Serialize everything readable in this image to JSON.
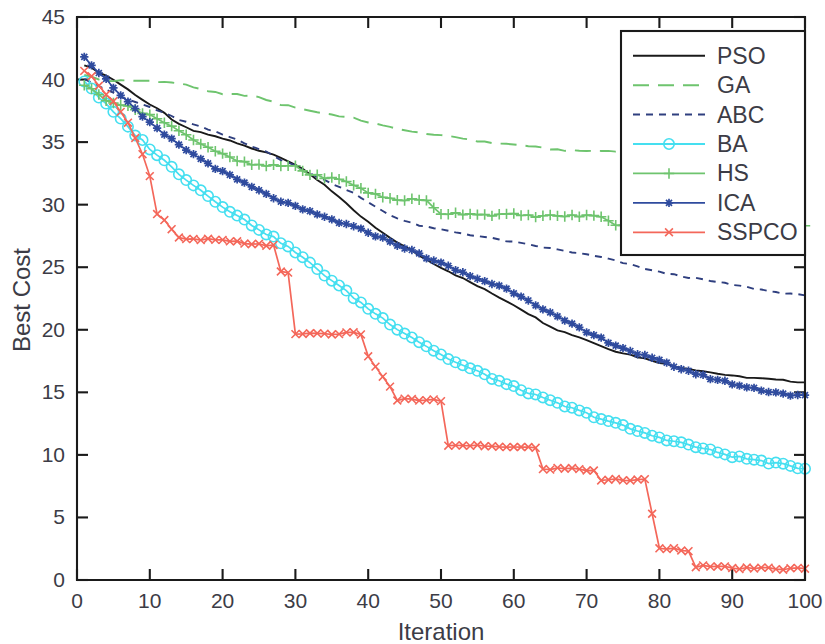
{
  "chart_data": {
    "type": "line",
    "title": "",
    "xlabel": "Iteration",
    "ylabel": "Best Cost",
    "xlim": [
      0,
      100
    ],
    "ylim": [
      0,
      45
    ],
    "xticks": [
      0,
      10,
      20,
      30,
      40,
      50,
      60,
      70,
      80,
      90,
      100
    ],
    "yticks": [
      0,
      5,
      10,
      15,
      20,
      25,
      30,
      35,
      40,
      45
    ],
    "grid": false,
    "legend_position": "top-right",
    "series": [
      {
        "name": "PSO",
        "color": "#1a1a1a",
        "style": "solid",
        "marker": "none",
        "x": [
          1,
          2,
          3,
          4,
          5,
          6,
          7,
          8,
          9,
          10,
          12,
          14,
          16,
          18,
          20,
          22,
          24,
          26,
          28,
          30,
          32,
          34,
          36,
          38,
          40,
          42,
          44,
          46,
          48,
          50,
          52,
          54,
          56,
          58,
          60,
          62,
          64,
          66,
          68,
          70,
          72,
          74,
          76,
          78,
          80,
          82,
          84,
          86,
          88,
          90,
          92,
          94,
          96,
          98,
          100
        ],
        "y": [
          41.2,
          40.9,
          40.6,
          40.3,
          40.0,
          39.6,
          39.2,
          38.8,
          38.4,
          38.0,
          37.3,
          36.4,
          35.9,
          35.6,
          35.3,
          34.9,
          34.5,
          34.2,
          33.8,
          33.2,
          32.4,
          31.6,
          30.6,
          29.5,
          28.6,
          27.7,
          27.0,
          26.3,
          25.6,
          25.0,
          24.4,
          23.8,
          23.2,
          22.6,
          22.0,
          21.3,
          20.6,
          20.0,
          19.6,
          19.2,
          18.7,
          18.3,
          18.0,
          17.7,
          17.4,
          17.1,
          16.9,
          16.7,
          16.5,
          16.3,
          16.2,
          16.1,
          16.0,
          15.9,
          15.8
        ]
      },
      {
        "name": "GA",
        "color": "#6ec46e",
        "style": "dashed",
        "marker": "none",
        "x": [
          1,
          2,
          3,
          4,
          5,
          6,
          8,
          10,
          12,
          14,
          16,
          18,
          20,
          22,
          24,
          26,
          28,
          30,
          32,
          34,
          36,
          38,
          40,
          42,
          44,
          46,
          48,
          50,
          52,
          54,
          56,
          58,
          60,
          62,
          64,
          66,
          68,
          70,
          72,
          74,
          76,
          78,
          80,
          82,
          84,
          86,
          88,
          90,
          92,
          94,
          96,
          98,
          100
        ],
        "y": [
          40.4,
          40.2,
          40.0,
          39.9,
          39.9,
          39.9,
          39.9,
          39.9,
          39.8,
          39.7,
          39.4,
          39.1,
          38.8,
          38.8,
          38.7,
          38.4,
          38.0,
          37.8,
          37.5,
          37.3,
          37.1,
          36.9,
          36.6,
          36.3,
          36.1,
          35.8,
          35.7,
          35.5,
          35.4,
          35.2,
          35.0,
          34.9,
          34.8,
          34.7,
          34.5,
          34.4,
          34.3,
          34.3,
          34.3,
          34.3,
          34.3,
          34.3,
          34.3,
          34.3,
          34.2,
          34.2,
          34.2,
          34.2,
          34.1,
          34.0,
          33.9,
          33.8,
          33.7
        ]
      },
      {
        "name": "ABC",
        "color": "#2f3f7f",
        "style": "dotted",
        "marker": "none",
        "x": [
          1,
          2,
          3,
          4,
          5,
          6,
          8,
          10,
          12,
          14,
          16,
          18,
          20,
          22,
          24,
          26,
          28,
          30,
          32,
          34,
          36,
          38,
          40,
          42,
          44,
          46,
          48,
          50,
          52,
          54,
          56,
          58,
          60,
          62,
          64,
          66,
          68,
          70,
          72,
          74,
          76,
          78,
          80,
          82,
          84,
          86,
          88,
          90,
          92,
          94,
          96,
          98,
          100
        ],
        "y": [
          40.1,
          39.8,
          39.5,
          39.2,
          38.9,
          38.6,
          38.2,
          37.8,
          37.3,
          36.8,
          36.4,
          36.0,
          35.6,
          35.2,
          34.7,
          34.2,
          33.6,
          33.1,
          32.5,
          32.0,
          31.4,
          30.9,
          30.2,
          29.5,
          28.9,
          28.5,
          28.2,
          28.0,
          27.8,
          27.6,
          27.4,
          27.2,
          27.0,
          26.8,
          26.6,
          26.4,
          26.2,
          26.0,
          25.8,
          25.5,
          25.2,
          24.9,
          24.6,
          24.4,
          24.2,
          24.0,
          23.8,
          23.6,
          23.4,
          23.2,
          23.0,
          22.9,
          22.7
        ]
      },
      {
        "name": "BA",
        "color": "#45dff0",
        "style": "solid",
        "marker": "circle",
        "x": [
          1,
          2,
          3,
          4,
          5,
          6,
          7,
          8,
          9,
          10,
          12,
          14,
          16,
          18,
          20,
          22,
          24,
          26,
          28,
          30,
          32,
          34,
          36,
          38,
          40,
          42,
          44,
          46,
          48,
          50,
          52,
          54,
          56,
          58,
          60,
          62,
          64,
          66,
          68,
          70,
          72,
          74,
          76,
          78,
          80,
          82,
          84,
          86,
          88,
          90,
          92,
          94,
          96,
          98,
          100
        ],
        "y": [
          39.9,
          39.3,
          38.6,
          38.0,
          37.4,
          36.8,
          36.2,
          35.6,
          35.1,
          34.5,
          33.5,
          32.5,
          31.6,
          30.7,
          29.9,
          29.1,
          28.4,
          27.7,
          27.0,
          26.2,
          25.3,
          24.4,
          23.5,
          22.6,
          21.7,
          20.9,
          20.1,
          19.4,
          18.7,
          18.0,
          17.4,
          16.9,
          16.4,
          15.9,
          15.4,
          15.0,
          14.5,
          14.1,
          13.7,
          13.3,
          12.9,
          12.5,
          12.1,
          11.7,
          11.4,
          11.1,
          10.8,
          10.5,
          10.2,
          9.9,
          9.7,
          9.5,
          9.3,
          9.1,
          8.9
        ]
      },
      {
        "name": "HS",
        "color": "#6ec46e",
        "style": "solid",
        "marker": "plus",
        "x": [
          1,
          2,
          3,
          4,
          5,
          6,
          7,
          8,
          9,
          10,
          12,
          14,
          15,
          16,
          18,
          20,
          22,
          24,
          26,
          28,
          30,
          32,
          34,
          35,
          36,
          38,
          40,
          42,
          44,
          46,
          48,
          50,
          52,
          54,
          56,
          58,
          60,
          62,
          64,
          66,
          68,
          70,
          72,
          74,
          76,
          78,
          80,
          82,
          84,
          86,
          88,
          90,
          92,
          94,
          96,
          98,
          100
        ],
        "y": [
          39.6,
          39.2,
          38.8,
          38.4,
          38.2,
          38.0,
          37.8,
          37.6,
          37.4,
          37.2,
          36.5,
          36.0,
          35.6,
          35.2,
          34.6,
          34.0,
          33.5,
          33.2,
          33.1,
          33.1,
          33.1,
          32.4,
          32.2,
          32.1,
          32.0,
          31.6,
          31.0,
          30.6,
          30.4,
          30.4,
          30.3,
          29.3,
          29.3,
          29.3,
          29.2,
          29.2,
          29.2,
          29.1,
          29.1,
          29.1,
          29.1,
          29.1,
          29.1,
          28.3,
          28.3,
          28.3,
          28.3,
          28.3,
          28.3,
          28.3,
          28.3,
          28.3,
          28.3,
          28.3,
          28.3,
          28.3,
          28.3
        ]
      },
      {
        "name": "ICA",
        "color": "#2f4b9e",
        "style": "solid",
        "marker": "star",
        "x": [
          1,
          2,
          3,
          4,
          5,
          6,
          7,
          8,
          9,
          10,
          12,
          14,
          16,
          18,
          20,
          22,
          24,
          26,
          28,
          30,
          32,
          34,
          36,
          38,
          40,
          42,
          44,
          46,
          48,
          50,
          52,
          54,
          56,
          58,
          60,
          62,
          64,
          66,
          68,
          70,
          72,
          74,
          76,
          78,
          80,
          82,
          84,
          86,
          88,
          90,
          92,
          94,
          96,
          98,
          100
        ],
        "y": [
          41.9,
          41.2,
          40.6,
          40.0,
          39.4,
          38.8,
          38.2,
          37.6,
          37.0,
          36.5,
          35.6,
          34.8,
          34.0,
          33.3,
          32.6,
          32.0,
          31.4,
          30.8,
          30.3,
          29.8,
          29.4,
          29.0,
          28.6,
          28.2,
          27.8,
          27.3,
          26.8,
          26.3,
          25.8,
          25.3,
          24.8,
          24.3,
          23.9,
          23.5,
          23.0,
          22.4,
          21.7,
          21.0,
          20.4,
          19.8,
          19.3,
          18.8,
          18.3,
          17.9,
          17.5,
          17.1,
          16.7,
          16.3,
          16.0,
          15.7,
          15.4,
          15.2,
          15.0,
          14.8,
          14.7
        ]
      },
      {
        "name": "SSPCO",
        "color": "#f4675a",
        "style": "solid",
        "marker": "x",
        "x": [
          1,
          2,
          3,
          4,
          5,
          6,
          7,
          8,
          9,
          10,
          11,
          12,
          14,
          16,
          18,
          20,
          22,
          24,
          26,
          27,
          28,
          29,
          30,
          32,
          34,
          36,
          38,
          39,
          40,
          41,
          42,
          43,
          44,
          45,
          46,
          48,
          50,
          51,
          52,
          54,
          56,
          58,
          60,
          62,
          63,
          64,
          65,
          66,
          68,
          70,
          71,
          72,
          74,
          76,
          78,
          80,
          82,
          84,
          85,
          86,
          88,
          90,
          92,
          94,
          96,
          98,
          100
        ],
        "y": [
          40.6,
          40.2,
          39.6,
          38.9,
          38.2,
          37.5,
          36.6,
          35.4,
          34.0,
          32.3,
          29.2,
          28.7,
          27.3,
          27.2,
          27.2,
          27.1,
          27.0,
          26.9,
          26.8,
          26.7,
          24.6,
          24.5,
          19.7,
          19.7,
          19.7,
          19.7,
          19.7,
          19.7,
          17.8,
          17.1,
          16.3,
          15.4,
          14.4,
          14.4,
          14.4,
          14.4,
          14.3,
          10.8,
          10.7,
          10.7,
          10.7,
          10.7,
          10.6,
          10.6,
          10.5,
          8.9,
          8.9,
          8.9,
          8.9,
          8.8,
          8.8,
          8.0,
          8.0,
          8.0,
          8.0,
          2.6,
          2.5,
          2.4,
          1.1,
          1.1,
          1.0,
          1.0,
          0.9,
          0.9,
          0.9,
          0.9,
          0.9
        ]
      }
    ]
  },
  "legend": {
    "entries": [
      {
        "label": "PSO"
      },
      {
        "label": "GA"
      },
      {
        "label": "ABC"
      },
      {
        "label": "BA"
      },
      {
        "label": "HS"
      },
      {
        "label": "ICA"
      },
      {
        "label": "SSPCO"
      }
    ]
  }
}
